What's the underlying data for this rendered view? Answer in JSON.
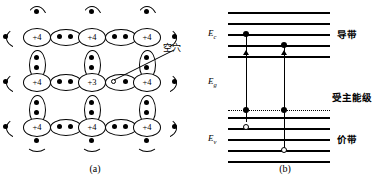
{
  "figure": {
    "panels": [
      {
        "id": "a",
        "caption": "(a)",
        "title": "acceptor-doped-lattice"
      },
      {
        "id": "b",
        "caption": "(b)",
        "title": "energy-band-diagram"
      }
    ]
  },
  "lattice": {
    "annotation": "空穴",
    "cores": [
      {
        "label": "+4"
      },
      {
        "label": "+4"
      },
      {
        "label": "+4"
      },
      {
        "label": "+4"
      },
      {
        "label": "+3"
      },
      {
        "label": "+4"
      },
      {
        "label": "+4"
      },
      {
        "label": "+4"
      },
      {
        "label": "+4"
      }
    ],
    "dopant_label": "+3",
    "host_label": "+4"
  },
  "bands": {
    "conduction_label": "导带",
    "acceptor_label": "受主能级",
    "valence_label": "价带",
    "energy_labels": {
      "conduction_edge": "E",
      "conduction_sub": "c",
      "gap": "E",
      "gap_sub": "g",
      "valence_edge": "E",
      "valence_sub": "v"
    }
  },
  "colors": {
    "ink": "#000000",
    "paper": "#ffffff"
  }
}
